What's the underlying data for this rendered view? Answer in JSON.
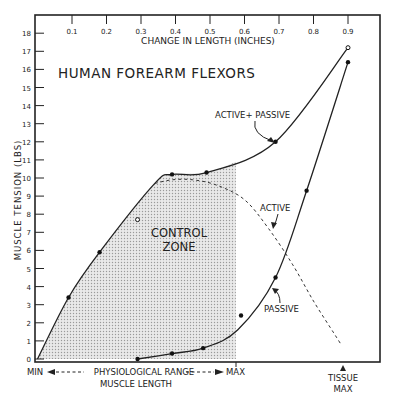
{
  "chart_data": {
    "type": "line",
    "title": "HUMAN FOREARM FLEXORS",
    "xlabel_top": "CHANGE IN LENGTH (INCHES)",
    "ylabel": "MUSCLE TENSION (LBS)",
    "xlabel_bottom": "MUSCLE LENGTH",
    "x_ticks": [
      "0.1",
      "0.2",
      "0.3",
      "0.4",
      "0.5",
      "0.6",
      "0.7",
      "0.8",
      "0.9"
    ],
    "y_ticks": [
      "0",
      "1",
      "2",
      "3",
      "4",
      "5",
      "6",
      "7",
      "8",
      "9",
      "10",
      "11",
      "12",
      "13",
      "14",
      "15",
      "16",
      "17",
      "18"
    ],
    "xlim": [
      0,
      1.0
    ],
    "ylim": [
      0,
      18.5
    ],
    "grid": false,
    "series": [
      {
        "name": "ACTIVE + PASSIVE",
        "style": "solid",
        "x": [
          0.0,
          0.09,
          0.18,
          0.34,
          0.39,
          0.49,
          0.69,
          0.9
        ],
        "y": [
          0.0,
          3.4,
          5.9,
          9.7,
          10.2,
          10.3,
          12.0,
          17.2
        ]
      },
      {
        "name": "ACTIVE",
        "style": "dashed",
        "x": [
          0.34,
          0.39,
          0.45,
          0.52,
          0.6,
          0.67,
          0.74,
          0.8,
          0.86,
          0.88
        ],
        "y": [
          9.7,
          9.9,
          9.9,
          9.6,
          8.8,
          7.2,
          5.2,
          3.2,
          1.4,
          0.8
        ]
      },
      {
        "name": "PASSIVE",
        "style": "solid",
        "x": [
          0.29,
          0.39,
          0.48,
          0.58,
          0.69,
          0.78,
          0.9
        ],
        "y": [
          0.0,
          0.3,
          0.6,
          1.6,
          4.5,
          9.3,
          16.4
        ]
      }
    ],
    "points_filled": [
      {
        "x": 0.09,
        "y": 3.4
      },
      {
        "x": 0.18,
        "y": 5.9
      },
      {
        "x": 0.39,
        "y": 10.2
      },
      {
        "x": 0.49,
        "y": 10.3
      },
      {
        "x": 0.69,
        "y": 12.0
      },
      {
        "x": 0.29,
        "y": 0.0
      },
      {
        "x": 0.39,
        "y": 0.3
      },
      {
        "x": 0.48,
        "y": 0.6
      },
      {
        "x": 0.59,
        "y": 2.4
      },
      {
        "x": 0.69,
        "y": 4.5
      },
      {
        "x": 0.78,
        "y": 9.3
      },
      {
        "x": 0.9,
        "y": 16.4
      }
    ],
    "points_open": [
      {
        "x": 0.29,
        "y": 7.7
      },
      {
        "x": 0.9,
        "y": 17.2
      }
    ],
    "shaded_region": {
      "label": "CONTROL ZONE",
      "x_max": 0.575
    },
    "annotations": {
      "active_passive": "ACTIVE+ PASSIVE",
      "active": "ACTIVE",
      "passive": "PASSIVE",
      "control_line1": "CONTROL",
      "control_line2": "ZONE",
      "min": "MIN",
      "physio_range": "PHYSIOLOGICAL RANGE",
      "max": "MAX",
      "tissue1": "TISSUE",
      "tissue2": "MAX"
    }
  }
}
